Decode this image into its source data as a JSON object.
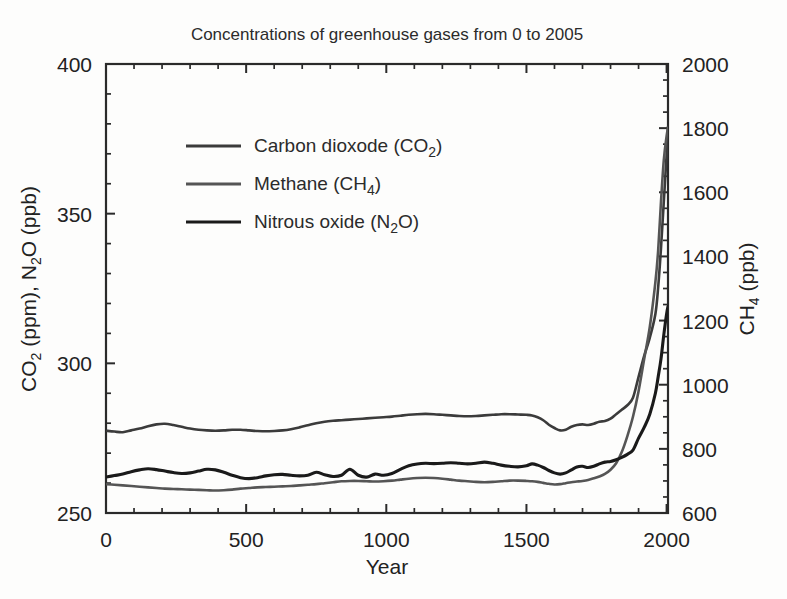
{
  "chart_data": {
    "type": "line",
    "title": "Concentrations of greenhouse gases from 0 to 2005",
    "xlabel": "Year",
    "ylabel_left": "CO2 (ppm), N2O (ppb)",
    "ylabel_right": "CH4 (ppb)",
    "xlim": [
      0,
      2005
    ],
    "ylim_left": [
      250,
      400
    ],
    "ylim_right": [
      600,
      2000
    ],
    "xticks": [
      0,
      500,
      1000,
      1500,
      2000
    ],
    "xtick_labels": [
      "0",
      "500",
      "1000",
      "1500",
      "2000"
    ],
    "x_minor_step": 100,
    "yticks_left": [
      250,
      300,
      350,
      400
    ],
    "ytick_labels_left": [
      "250",
      "300",
      "350",
      "400"
    ],
    "y_minor_step_left": 10,
    "yticks_right": [
      600,
      800,
      1000,
      1200,
      1400,
      1600,
      1800,
      2000
    ],
    "ytick_labels_right": [
      "600",
      "800",
      "1000",
      "1200",
      "1400",
      "1600",
      "1800",
      "2000"
    ],
    "y_minor_step_right": 50,
    "grid": false,
    "legend_position": "upper-left-inside",
    "legend_entries": [
      "Carbon dioxode (CO₂)",
      "Methane (CH₄)",
      "Nitrous oxide (N₂O)"
    ],
    "series": [
      {
        "name": "Carbon dioxode (CO2)",
        "label_html": "Carbon dioxode (CO<sub>2</sub>)",
        "axis": "left",
        "units": "ppm",
        "color": "#3b3b3b",
        "x": [
          0,
          30,
          60,
          90,
          120,
          150,
          180,
          210,
          240,
          270,
          300,
          330,
          360,
          390,
          420,
          450,
          480,
          510,
          540,
          570,
          600,
          630,
          660,
          690,
          720,
          750,
          780,
          810,
          840,
          870,
          900,
          930,
          960,
          990,
          1020,
          1050,
          1080,
          1110,
          1140,
          1170,
          1200,
          1230,
          1260,
          1290,
          1320,
          1350,
          1380,
          1410,
          1440,
          1470,
          1500,
          1520,
          1540,
          1560,
          1580,
          1600,
          1620,
          1640,
          1660,
          1680,
          1700,
          1720,
          1740,
          1760,
          1780,
          1800,
          1820,
          1840,
          1860,
          1880,
          1900,
          1920,
          1940,
          1960,
          1970,
          1980,
          1990,
          2000,
          2005
        ],
        "y": [
          277.5,
          277.2,
          277.0,
          277.6,
          278.2,
          279.0,
          279.6,
          279.8,
          279.4,
          278.8,
          278.2,
          277.8,
          277.6,
          277.5,
          277.6,
          277.8,
          277.8,
          277.6,
          277.4,
          277.3,
          277.4,
          277.6,
          278.0,
          278.6,
          279.3,
          280.0,
          280.5,
          280.8,
          281.0,
          281.2,
          281.4,
          281.6,
          281.8,
          282.0,
          282.2,
          282.5,
          282.8,
          283.0,
          283.1,
          283.0,
          282.8,
          282.6,
          282.4,
          282.3,
          282.4,
          282.6,
          282.8,
          283.0,
          283.0,
          282.9,
          282.8,
          282.6,
          282.0,
          281.0,
          279.5,
          278.4,
          277.6,
          277.8,
          278.8,
          279.4,
          279.6,
          279.4,
          279.8,
          280.5,
          280.7,
          281.5,
          283.0,
          284.5,
          286.0,
          288.5,
          295.5,
          302.5,
          308.5,
          316.5,
          325.5,
          338.5,
          354.0,
          369.5,
          379.0
        ]
      },
      {
        "name": "Methane (CH4)",
        "label_html": "Methane (CH<sub>4</sub>)",
        "axis": "right",
        "units": "ppb",
        "color": "#555555",
        "x": [
          0,
          30,
          60,
          90,
          120,
          150,
          180,
          210,
          240,
          270,
          300,
          330,
          360,
          390,
          420,
          450,
          480,
          510,
          540,
          570,
          600,
          630,
          660,
          690,
          720,
          750,
          780,
          810,
          840,
          870,
          900,
          930,
          960,
          990,
          1020,
          1050,
          1080,
          1110,
          1140,
          1170,
          1200,
          1230,
          1260,
          1290,
          1320,
          1350,
          1380,
          1410,
          1440,
          1470,
          1500,
          1520,
          1540,
          1560,
          1580,
          1600,
          1620,
          1640,
          1660,
          1680,
          1700,
          1720,
          1740,
          1760,
          1780,
          1800,
          1820,
          1840,
          1860,
          1880,
          1900,
          1920,
          1940,
          1960,
          1970,
          1980,
          1990,
          2000,
          2005
        ],
        "y": [
          690,
          688,
          686,
          684,
          682,
          680,
          678,
          676,
          675,
          674,
          673,
          672,
          671,
          670,
          671,
          673,
          676,
          678,
          680,
          681,
          682,
          683,
          684,
          686,
          688,
          690,
          693,
          696,
          699,
          700,
          700,
          699,
          698,
          699,
          701,
          704,
          707,
          709,
          710,
          709,
          707,
          704,
          701,
          699,
          697,
          696,
          697,
          699,
          701,
          701,
          700,
          699,
          697,
          694,
          691,
          689,
          690,
          693,
          696,
          698,
          700,
          703,
          708,
          714,
          722,
          735,
          755,
          790,
          840,
          900,
          980,
          1080,
          1180,
          1320,
          1420,
          1570,
          1700,
          1775,
          1800
        ]
      },
      {
        "name": "Nitrous oxide (N2O)",
        "label_html": "Nitrous oxide (N<sub>2</sub>O)",
        "axis": "left",
        "units": "ppb",
        "color": "#1a1a1a",
        "x": [
          0,
          30,
          60,
          90,
          120,
          150,
          180,
          210,
          240,
          270,
          300,
          330,
          360,
          390,
          420,
          450,
          480,
          510,
          540,
          570,
          600,
          630,
          660,
          690,
          720,
          750,
          780,
          810,
          840,
          870,
          900,
          930,
          960,
          990,
          1020,
          1050,
          1080,
          1110,
          1140,
          1170,
          1200,
          1230,
          1260,
          1290,
          1320,
          1350,
          1380,
          1410,
          1440,
          1470,
          1500,
          1520,
          1540,
          1560,
          1580,
          1600,
          1620,
          1640,
          1660,
          1680,
          1700,
          1720,
          1740,
          1760,
          1780,
          1800,
          1820,
          1840,
          1860,
          1880,
          1900,
          1920,
          1940,
          1960,
          1970,
          1980,
          1990,
          2000,
          2005
        ],
        "y": [
          262.0,
          262.5,
          263.0,
          263.8,
          264.4,
          264.8,
          264.5,
          264.0,
          263.5,
          263.2,
          263.4,
          264.0,
          264.6,
          264.4,
          263.6,
          262.6,
          261.8,
          261.5,
          261.8,
          262.4,
          262.8,
          262.9,
          262.6,
          262.4,
          262.6,
          263.6,
          262.8,
          262.2,
          262.6,
          264.6,
          262.6,
          262.0,
          263.0,
          262.6,
          263.2,
          264.6,
          265.8,
          266.4,
          266.6,
          266.5,
          266.6,
          266.8,
          266.6,
          266.4,
          266.6,
          267.0,
          266.6,
          266.0,
          265.6,
          265.4,
          265.8,
          266.4,
          266.0,
          265.2,
          264.2,
          263.4,
          263.0,
          263.4,
          264.4,
          265.4,
          265.6,
          265.2,
          265.6,
          266.4,
          267.0,
          267.2,
          267.8,
          268.6,
          269.6,
          271.0,
          275.0,
          278.6,
          283.0,
          290.0,
          295.5,
          301.5,
          309.5,
          316.5,
          319.0
        ]
      }
    ]
  }
}
